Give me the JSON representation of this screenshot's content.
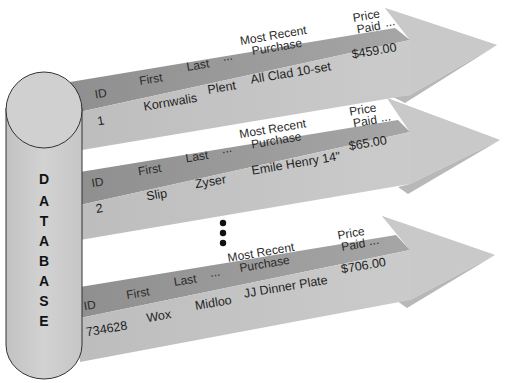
{
  "database": {
    "label_letters": [
      "D",
      "A",
      "T",
      "A",
      "B",
      "A",
      "S",
      "E"
    ]
  },
  "columns": {
    "id": "ID",
    "first": "First",
    "last": "Last",
    "ellipsis": "...",
    "purchase_line1": "Most Recent",
    "purchase_line2": "Purchase",
    "price_line1": "Price",
    "price_line2": "Paid"
  },
  "records": [
    {
      "id": "1",
      "first": "Kornwalis",
      "last": "Plent",
      "purchase": "All Clad 10-set",
      "price": "$459.00"
    },
    {
      "id": "2",
      "first": "Slip",
      "last": "Zyser",
      "purchase": "Emile Henry 14\"",
      "price": "$65.00"
    },
    {
      "id": "734628",
      "first": "Wox",
      "last": "Midloo",
      "purchase": "JJ Dinner Plate",
      "price": "$706.00"
    }
  ],
  "continuation": "vertical-ellipsis",
  "colors": {
    "header_band": "#9a9a9a",
    "body_band": "#c4c4c4",
    "arrow_head_light": "#cfcfcf",
    "arrow_head_dark": "#b2b2b2",
    "cylinder_fill": "#cdcdcd",
    "cylinder_stroke": "#333333"
  }
}
